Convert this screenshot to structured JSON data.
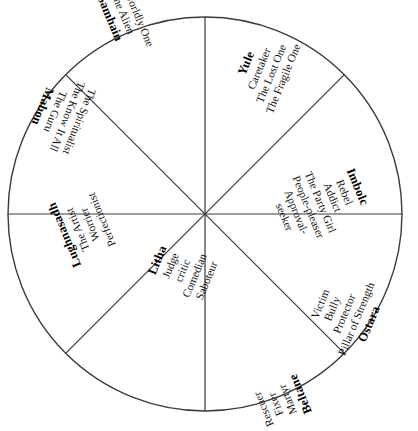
{
  "diagram": {
    "type": "wheel-of-the-year-archetypes",
    "shape": "circle-divided-into-eight-sectors",
    "circle": {
      "center_x": 205,
      "center_y": 214,
      "radius": 197,
      "stroke_color": "#3a3a3a",
      "fill_color": "#ffffff"
    },
    "divider_count": 8
  },
  "sectors": [
    {
      "id": "yule",
      "festival": "Yule",
      "position": "top-right",
      "archetypes": [
        "Caretaker",
        "The Lost One",
        "The Fragile One"
      ]
    },
    {
      "id": "imbolc",
      "festival": "Imbolc",
      "position": "right-upper",
      "archetypes": [
        "Rebel",
        "Addict",
        "The Party Girl",
        "People-pleaser",
        "Approval-",
        "seeker"
      ]
    },
    {
      "id": "ostara",
      "festival": "Ostara",
      "position": "right-lower",
      "archetypes": [
        "Victim",
        "Bully",
        "Protector",
        "Pillar of Strength"
      ]
    },
    {
      "id": "beltane",
      "festival": "Beltane",
      "position": "bottom-right",
      "archetypes": [
        "Rescuer",
        "Fixer",
        "Martyr"
      ]
    },
    {
      "id": "litha",
      "festival": "Litha",
      "position": "bottom-left",
      "archetypes": [
        "Saboteur",
        "Comedian",
        "critic",
        "Judge"
      ]
    },
    {
      "id": "lughnasadh",
      "festival": "Lughnasadh",
      "position": "left-lower",
      "archetypes": [
        "Perfectionist",
        "Worrier",
        "The Artist"
      ]
    },
    {
      "id": "mabon",
      "festival": "Mabon",
      "position": "left-upper",
      "archetypes": [
        "The Guru",
        "The Know It All",
        "The Spiritualist"
      ]
    },
    {
      "id": "samhain",
      "festival": "Samhain",
      "position": "top-left",
      "archetypes": [
        "The Alien",
        "Otherworldly One"
      ]
    }
  ]
}
